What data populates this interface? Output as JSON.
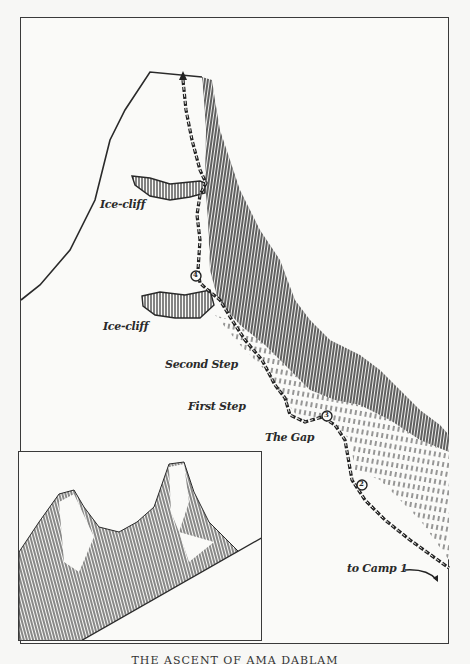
{
  "figure": {
    "type": "route-map illustration",
    "caption": "THE ASCENT OF AMA DABLAM",
    "colors": {
      "ink": "#2a2a2a",
      "paper": "#fafaf8",
      "shade": "#3a3a3a"
    }
  },
  "labels": {
    "ice_cliff_upper": "Ice-cliff",
    "ice_cliff_lower": "Ice-cliff",
    "second_step": "Second Step",
    "first_step": "First Step",
    "the_gap": "The Gap",
    "to_camp": "to Camp 1"
  },
  "route_markers": [
    {
      "id": "2",
      "label": "2"
    },
    {
      "id": "3",
      "label": "3"
    },
    {
      "id": "4",
      "label": "4"
    }
  ],
  "inset": {
    "description": "perspective sketch of the twin-peaked mountain"
  }
}
